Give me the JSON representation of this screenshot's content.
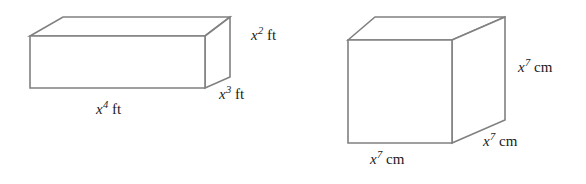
{
  "page": {
    "background_color": "#ffffff",
    "edge_color": "#808080",
    "face_color": "#ffffff",
    "text_color": "#1a1a1a",
    "width": 586,
    "height": 184
  },
  "figures": [
    {
      "name": "rectangular-prism",
      "shape": "rectangular prism",
      "labels": {
        "length": {
          "variable": "x",
          "exponent": "4",
          "unit": "ft",
          "text": "x4 ft"
        },
        "depth": {
          "variable": "x",
          "exponent": "3",
          "unit": "ft",
          "text": "x3 ft"
        },
        "height": {
          "variable": "x",
          "exponent": "2",
          "unit": "ft",
          "text": "x2 ft"
        }
      }
    },
    {
      "name": "cube",
      "shape": "cube",
      "labels": {
        "width": {
          "variable": "x",
          "exponent": "7",
          "unit": "cm",
          "text": "x7 cm"
        },
        "depth": {
          "variable": "x",
          "exponent": "7",
          "unit": "cm",
          "text": "x7 cm"
        },
        "height": {
          "variable": "x",
          "exponent": "7",
          "unit": "cm",
          "text": "x7 cm"
        }
      }
    }
  ]
}
